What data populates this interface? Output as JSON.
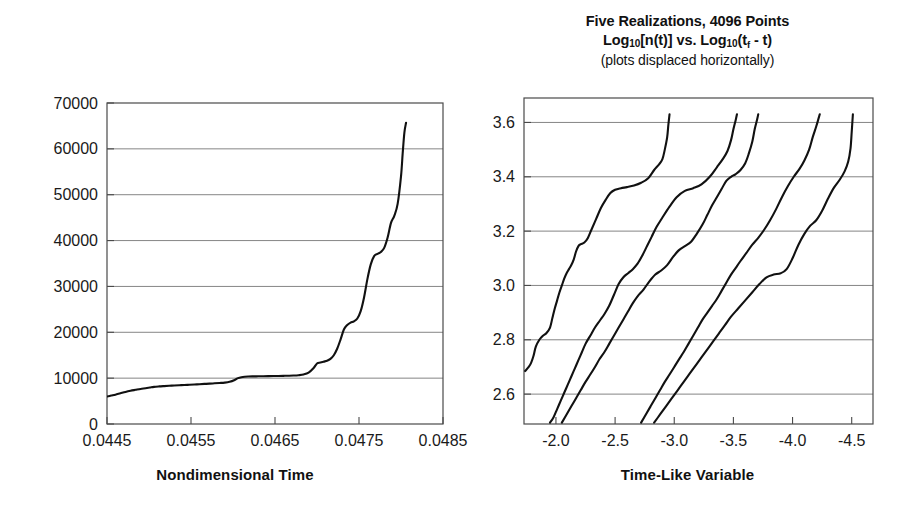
{
  "left_panel": {
    "xaxis_title": "Nondimensional Time",
    "y_ticks": [
      "0",
      "10000",
      "20000",
      "30000",
      "40000",
      "50000",
      "60000",
      "70000"
    ],
    "x_ticks": [
      "0.0445",
      "0.0455",
      "0.0465",
      "0.0475",
      "0.0485"
    ]
  },
  "right_panel": {
    "title_line1": "Five Realizations, 4096 Points",
    "title_line2_a": "Log",
    "title_line2_sub1": "10",
    "title_line2_b": "[n(t)] vs. Log",
    "title_line2_sub2": "10",
    "title_line2_c": "(t",
    "title_line2_sub3": "f",
    "title_line2_d": " - t)",
    "title_line3": "(plots displaced horizontally)",
    "xaxis_title": "Time-Like Variable",
    "y_ticks": [
      "2.6",
      "2.8",
      "3.0",
      "3.2",
      "3.4",
      "3.6"
    ],
    "x_ticks": [
      "-2.0",
      "-2.5",
      "-3.0",
      "-3.5",
      "-4.0",
      "-4.5"
    ]
  },
  "colors": {
    "line": "#111111",
    "grid": "#777777",
    "frame": "#4a4a4a",
    "background": "#ffffff"
  },
  "chart_data": [
    {
      "type": "line",
      "id": "left-chart",
      "title": "",
      "xlabel": "Nondimensional Time",
      "ylabel": "",
      "xlim": [
        0.0445,
        0.0485
      ],
      "ylim": [
        0,
        70000
      ],
      "xticks": [
        0.0445,
        0.0455,
        0.0465,
        0.0475,
        0.0485
      ],
      "yticks": [
        0,
        10000,
        20000,
        30000,
        40000,
        50000,
        60000,
        70000
      ],
      "grid": "horizontal",
      "legend": "none",
      "series": [
        {
          "name": "n(t)",
          "x": [
            0.0445,
            0.04455,
            0.0446,
            0.04466,
            0.04472,
            0.04478,
            0.04484,
            0.0449,
            0.04496,
            0.04501,
            0.04506,
            0.04512,
            0.04518,
            0.04524,
            0.0453,
            0.04536,
            0.04542,
            0.04548,
            0.04554,
            0.0456,
            0.04566,
            0.04572,
            0.04578,
            0.04584,
            0.0459,
            0.04596,
            0.04602,
            0.04606,
            0.0461,
            0.04614,
            0.04618,
            0.04624,
            0.0463,
            0.04636,
            0.04642,
            0.04648,
            0.04654,
            0.0466,
            0.04666,
            0.04672,
            0.04678,
            0.04684,
            0.0469,
            0.04696,
            0.047,
            0.04704,
            0.04708,
            0.04712,
            0.04716,
            0.0472,
            0.04724,
            0.04728,
            0.04732,
            0.04736,
            0.0474,
            0.04744,
            0.04748,
            0.04752,
            0.04756,
            0.0476,
            0.04764,
            0.04768,
            0.04772,
            0.04776,
            0.0478,
            0.04784,
            0.04788,
            0.04792,
            0.04796,
            0.048,
            0.04802,
            0.04804,
            0.04806
          ],
          "y": [
            6000,
            6200,
            6400,
            6700,
            7000,
            7250,
            7450,
            7650,
            7800,
            7950,
            8100,
            8200,
            8270,
            8330,
            8390,
            8450,
            8500,
            8560,
            8620,
            8680,
            8740,
            8800,
            8870,
            8940,
            9020,
            9200,
            9600,
            10000,
            10200,
            10300,
            10350,
            10380,
            10400,
            10420,
            10440,
            10460,
            10480,
            10500,
            10520,
            10560,
            10640,
            10800,
            11200,
            12200,
            13200,
            13400,
            13600,
            13800,
            14200,
            15000,
            16400,
            18400,
            20600,
            21600,
            22100,
            22400,
            23000,
            24600,
            27600,
            31600,
            34800,
            36600,
            37100,
            37500,
            38400,
            40600,
            43800,
            45400,
            48000,
            54000,
            59000,
            63500,
            65700
          ]
        }
      ]
    },
    {
      "type": "line",
      "id": "right-chart",
      "title": "Five Realizations, 4096 Points Log10[n(t)] vs. Log10(tf - t)",
      "subtitle": "(plots displaced horizontally)",
      "xlabel": "Time-Like Variable",
      "ylabel": "",
      "xlim": [
        -1.73,
        -4.68
      ],
      "ylim": [
        2.49,
        3.69
      ],
      "xticks": [
        -2.0,
        -2.5,
        -3.0,
        -3.5,
        -4.0,
        -4.5
      ],
      "yticks": [
        2.6,
        2.8,
        3.0,
        3.2,
        3.4,
        3.6
      ],
      "grid": "horizontal",
      "legend": "none",
      "note": "five displaced realizations of log10 n(t) vs log10(tf - t)",
      "series": [
        {
          "name": "realization-1",
          "x": [
            -1.74,
            -1.77,
            -1.79,
            -1.81,
            -1.83,
            -1.86,
            -1.89,
            -1.92,
            -1.95,
            -1.97,
            -1.99,
            -2.01,
            -2.03,
            -2.05,
            -2.07,
            -2.09,
            -2.11,
            -2.13,
            -2.15,
            -2.17,
            -2.19,
            -2.21,
            -2.24,
            -2.27,
            -2.3,
            -2.34,
            -2.38,
            -2.42,
            -2.46,
            -2.5,
            -2.55,
            -2.6,
            -2.66,
            -2.72,
            -2.78,
            -2.83,
            -2.87,
            -2.9,
            -2.92,
            -2.94,
            -2.95,
            -2.96
          ],
          "y": [
            2.685,
            2.7,
            2.715,
            2.74,
            2.775,
            2.8,
            2.815,
            2.825,
            2.845,
            2.88,
            2.915,
            2.945,
            2.975,
            3.0,
            3.025,
            3.045,
            3.06,
            3.075,
            3.095,
            3.125,
            3.145,
            3.152,
            3.158,
            3.175,
            3.205,
            3.245,
            3.285,
            3.315,
            3.34,
            3.352,
            3.358,
            3.362,
            3.368,
            3.378,
            3.395,
            3.425,
            3.445,
            3.465,
            3.5,
            3.545,
            3.59,
            3.63
          ]
        },
        {
          "name": "realization-2",
          "x": [
            -1.95,
            -1.98,
            -2.01,
            -2.04,
            -2.07,
            -2.1,
            -2.13,
            -2.16,
            -2.19,
            -2.22,
            -2.25,
            -2.29,
            -2.33,
            -2.37,
            -2.41,
            -2.45,
            -2.49,
            -2.53,
            -2.57,
            -2.61,
            -2.65,
            -2.69,
            -2.73,
            -2.77,
            -2.81,
            -2.85,
            -2.9,
            -2.96,
            -3.02,
            -3.09,
            -3.16,
            -3.23,
            -3.3,
            -3.36,
            -3.41,
            -3.45,
            -3.48,
            -3.5,
            -3.52,
            -3.53
          ],
          "y": [
            2.495,
            2.515,
            2.545,
            2.575,
            2.605,
            2.635,
            2.665,
            2.695,
            2.725,
            2.755,
            2.785,
            2.815,
            2.845,
            2.87,
            2.895,
            2.925,
            2.965,
            3.005,
            3.03,
            3.045,
            3.06,
            3.08,
            3.11,
            3.145,
            3.18,
            3.215,
            3.25,
            3.29,
            3.325,
            3.348,
            3.358,
            3.372,
            3.4,
            3.435,
            3.465,
            3.495,
            3.535,
            3.575,
            3.61,
            3.63
          ]
        },
        {
          "name": "realization-3",
          "x": [
            -2.05,
            -2.09,
            -2.13,
            -2.17,
            -2.21,
            -2.25,
            -2.29,
            -2.33,
            -2.37,
            -2.41,
            -2.45,
            -2.49,
            -2.53,
            -2.57,
            -2.61,
            -2.65,
            -2.69,
            -2.74,
            -2.79,
            -2.84,
            -2.89,
            -2.94,
            -2.99,
            -3.04,
            -3.09,
            -3.14,
            -3.19,
            -3.24,
            -3.28,
            -3.32,
            -3.36,
            -3.4,
            -3.44,
            -3.48,
            -3.52,
            -3.56,
            -3.6,
            -3.63,
            -3.66,
            -3.68,
            -3.7,
            -3.71
          ],
          "y": [
            2.495,
            2.525,
            2.555,
            2.585,
            2.615,
            2.645,
            2.672,
            2.7,
            2.73,
            2.755,
            2.785,
            2.815,
            2.845,
            2.875,
            2.905,
            2.935,
            2.96,
            2.985,
            3.015,
            3.04,
            3.055,
            3.075,
            3.105,
            3.13,
            3.145,
            3.16,
            3.19,
            3.225,
            3.26,
            3.295,
            3.325,
            3.355,
            3.385,
            3.4,
            3.41,
            3.425,
            3.45,
            3.485,
            3.53,
            3.575,
            3.61,
            3.63
          ]
        },
        {
          "name": "realization-4",
          "x": [
            -2.72,
            -2.76,
            -2.8,
            -2.84,
            -2.88,
            -2.92,
            -2.96,
            -3.0,
            -3.04,
            -3.08,
            -3.12,
            -3.16,
            -3.2,
            -3.24,
            -3.28,
            -3.32,
            -3.36,
            -3.4,
            -3.44,
            -3.48,
            -3.52,
            -3.56,
            -3.61,
            -3.66,
            -3.71,
            -3.76,
            -3.81,
            -3.86,
            -3.91,
            -3.96,
            -4.01,
            -4.06,
            -4.1,
            -4.14,
            -4.17,
            -4.2,
            -4.22,
            -4.23
          ],
          "y": [
            2.495,
            2.525,
            2.555,
            2.585,
            2.615,
            2.645,
            2.672,
            2.7,
            2.728,
            2.755,
            2.785,
            2.815,
            2.845,
            2.875,
            2.9,
            2.925,
            2.95,
            2.98,
            3.01,
            3.04,
            3.065,
            3.09,
            3.12,
            3.15,
            3.175,
            3.205,
            3.24,
            3.28,
            3.325,
            3.365,
            3.4,
            3.43,
            3.46,
            3.5,
            3.545,
            3.585,
            3.615,
            3.63
          ]
        },
        {
          "name": "realization-5",
          "x": [
            -2.83,
            -2.88,
            -2.93,
            -2.98,
            -3.03,
            -3.08,
            -3.13,
            -3.18,
            -3.23,
            -3.28,
            -3.33,
            -3.38,
            -3.43,
            -3.48,
            -3.54,
            -3.6,
            -3.66,
            -3.72,
            -3.78,
            -3.84,
            -3.9,
            -3.95,
            -4.0,
            -4.05,
            -4.1,
            -4.15,
            -4.2,
            -4.25,
            -4.3,
            -4.35,
            -4.4,
            -4.44,
            -4.47,
            -4.49,
            -4.5,
            -4.51
          ],
          "y": [
            2.495,
            2.525,
            2.555,
            2.585,
            2.615,
            2.645,
            2.675,
            2.705,
            2.735,
            2.765,
            2.795,
            2.825,
            2.855,
            2.885,
            2.915,
            2.945,
            2.975,
            3.005,
            3.03,
            3.04,
            3.045,
            3.06,
            3.1,
            3.15,
            3.19,
            3.22,
            3.24,
            3.275,
            3.32,
            3.36,
            3.39,
            3.42,
            3.455,
            3.505,
            3.565,
            3.63
          ]
        }
      ]
    }
  ]
}
